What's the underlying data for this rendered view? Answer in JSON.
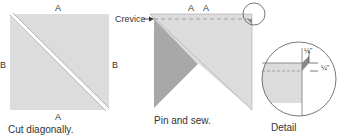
{
  "colors": {
    "light_fabric": "#dcdcdc",
    "dark_fabric": "#a8a8a8",
    "outline": "#555555",
    "background": "#ffffff"
  },
  "panel1": {
    "label_top": "A",
    "label_bottom": "A",
    "label_left": "B",
    "label_right": "B",
    "caption": "Cut diagonally."
  },
  "panel2": {
    "crevice_label": "Crevice",
    "label_a1": "A",
    "label_a2": "A",
    "label_left": "B",
    "caption": "Pin and sew."
  },
  "panel3": {
    "measure_top": "¼\"",
    "measure_right": "¼\"",
    "caption": "Detail"
  }
}
